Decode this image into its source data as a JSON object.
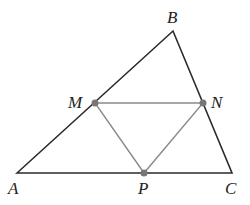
{
  "diagram": {
    "type": "triangle-midpoints",
    "colors": {
      "outer_triangle": "#2b2b2b",
      "inner_triangle": "#8a8a8a",
      "points": "#777777",
      "labels": "#222222"
    },
    "vertices": {
      "A": {
        "label": "A",
        "x": 17,
        "y": 173
      },
      "B": {
        "label": "B",
        "x": 173,
        "y": 31
      },
      "C": {
        "label": "C",
        "x": 232,
        "y": 173
      }
    },
    "midpoints": {
      "M": {
        "label": "M",
        "x": 95,
        "y": 103
      },
      "N": {
        "label": "N",
        "x": 203,
        "y": 103
      },
      "P": {
        "label": "P",
        "x": 144,
        "y": 173
      }
    },
    "label_positions": {
      "A": {
        "x": 8,
        "y": 194
      },
      "B": {
        "x": 167,
        "y": 23
      },
      "C": {
        "x": 225,
        "y": 194
      },
      "M": {
        "x": 68,
        "y": 108
      },
      "N": {
        "x": 211,
        "y": 108
      },
      "P": {
        "x": 138,
        "y": 194
      }
    }
  }
}
